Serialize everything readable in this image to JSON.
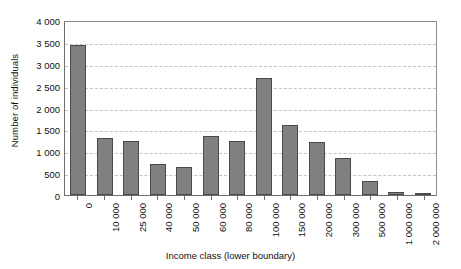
{
  "chart_data": {
    "type": "bar",
    "title": "",
    "xlabel": "Income class (lower boundary)",
    "ylabel": "Number of individuals",
    "categories": [
      "0",
      "10 000",
      "25 000",
      "40 000",
      "50 000",
      "60 000",
      "80 000",
      "100 000",
      "150 000",
      "200 000",
      "300 000",
      "500 000",
      "1 000 000",
      "2 000 000"
    ],
    "values": [
      3430,
      1300,
      1230,
      700,
      630,
      1340,
      1240,
      2680,
      1600,
      1210,
      840,
      320,
      80,
      20
    ],
    "ylim": [
      0,
      4000
    ],
    "ytick_values": [
      0,
      500,
      1000,
      1500,
      2000,
      2500,
      3000,
      3500,
      4000
    ],
    "ytick_labels": [
      "0",
      "500",
      "1 000",
      "1 500",
      "2 000",
      "2 500",
      "3 000",
      "3 500",
      "4 000"
    ],
    "grid": true,
    "grid_axis": "y",
    "grid_style": "dashed",
    "legend": false,
    "bar_color": "#808080",
    "bar_border_color": "#4a4a4a",
    "grid_color": "#c4c4c4",
    "axis_color": "#6e6e6e",
    "text_color": "#111111",
    "background": "#ffffff",
    "xtick_rotation": -90
  }
}
